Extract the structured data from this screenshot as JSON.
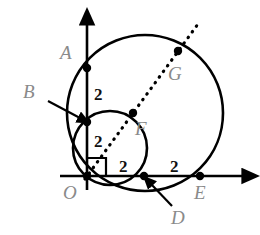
{
  "figure": {
    "kind": "geometry-diagram",
    "width": 260,
    "height": 235,
    "background_color": "#ffffff",
    "stroke_color": "#000000",
    "label_color": "#8a8a8a",
    "measure_color": "#111111"
  },
  "axes": {
    "x_axis": {
      "name": "x-axis",
      "from": [
        60,
        176
      ],
      "to": [
        248,
        176
      ],
      "arrow": "right"
    },
    "y_axis": {
      "name": "y-axis",
      "from": [
        87,
        190
      ],
      "to": [
        87,
        18
      ],
      "arrow": "up"
    },
    "right_angle_marker": {
      "name": "right-angle-at-origin",
      "x": 88,
      "y": 158,
      "size": 18
    }
  },
  "circles": [
    {
      "name": "large-circle",
      "cx": 145,
      "cy": 113,
      "r": 78,
      "style": "solid"
    },
    {
      "name": "small-circle",
      "cx": 110,
      "cy": 148,
      "r": 37,
      "style": "solid"
    }
  ],
  "dotted_line": {
    "name": "diagonal-dotted-ray",
    "from": [
      85,
      179
    ],
    "to": [
      198,
      24
    ],
    "style": "dotted"
  },
  "points": [
    {
      "id": "A",
      "label": "A",
      "cx": 87,
      "cy": 68,
      "label_x": 60,
      "label_y": 43,
      "dot": true
    },
    {
      "id": "B",
      "label": "B",
      "cx": 87,
      "cy": 122,
      "label_x": 23,
      "label_y": 82,
      "dot": true
    },
    {
      "id": "F",
      "label": "F",
      "cx": 133,
      "cy": 113,
      "label_x": 135,
      "label_y": 119,
      "dot": true
    },
    {
      "id": "G",
      "label": "G",
      "cx": 178,
      "cy": 51,
      "label_x": 168,
      "label_y": 64,
      "dot": true
    },
    {
      "id": "O",
      "label": "O",
      "cx": 87,
      "cy": 176,
      "label_x": 63,
      "label_y": 183,
      "dot": true
    },
    {
      "id": "D",
      "label": "D",
      "cx": 144,
      "cy": 176,
      "label_x": 171,
      "label_y": 208,
      "dot": true
    },
    {
      "id": "E",
      "label": "E",
      "cx": 200,
      "cy": 176,
      "label_x": 194,
      "label_y": 183,
      "dot": true
    }
  ],
  "leader_arrows": [
    {
      "name": "leader-arrow-to-b",
      "from": [
        48,
        101
      ],
      "to": [
        84,
        120
      ]
    },
    {
      "name": "leader-arrow-to-d",
      "from": [
        171,
        205
      ],
      "to": [
        149,
        182
      ]
    }
  ],
  "measures": [
    {
      "name": "segment-length-ab",
      "value": "2",
      "x": 94,
      "y": 86,
      "describes": "A to B"
    },
    {
      "name": "segment-length-bo",
      "value": "2",
      "x": 94,
      "y": 133,
      "describes": "B to O"
    },
    {
      "name": "segment-length-od",
      "value": "2",
      "x": 119,
      "y": 158,
      "describes": "O to D"
    },
    {
      "name": "segment-length-de",
      "value": "2",
      "x": 170,
      "y": 158,
      "describes": "D to E"
    }
  ]
}
